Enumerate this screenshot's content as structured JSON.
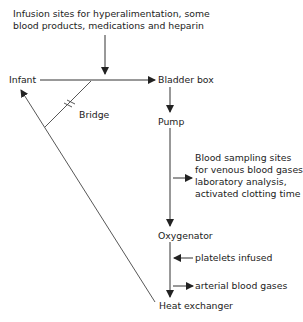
{
  "diagram": {
    "type": "flow",
    "nodes": {
      "infusion_note": [
        "Infusion sites for hyperalimentation, some",
        "blood products, medications and heparin"
      ],
      "infant": "Infant",
      "bladder_box": "Bladder box",
      "bridge": "Bridge",
      "pump": "Pump",
      "sampling_note": [
        "Blood sampling sites",
        "for venous blood gases,",
        "laboratory analysis,",
        "activated clotting time"
      ],
      "oxygenator": "Oxygenator",
      "platelets": "platelets infused",
      "arterial": "arterial blood gases",
      "heat_exchanger": "Heat exchanger"
    },
    "edges": [
      {
        "from": "Infant",
        "to": "Bladder box"
      },
      {
        "from": "Infusion sites",
        "to": "Infant-Bladder box line"
      },
      {
        "from": "Bladder box",
        "to": "Pump"
      },
      {
        "from": "Pump",
        "to": "Oxygenator"
      },
      {
        "from": "Pump-Oxygenator line",
        "to": "Blood sampling sites"
      },
      {
        "from": "platelets infused",
        "to": "Oxygenator-Heat exchanger line"
      },
      {
        "from": "Oxygenator-Heat exchanger line",
        "to": "arterial blood gases"
      },
      {
        "from": "Oxygenator",
        "to": "Heat exchanger"
      },
      {
        "from": "Heat exchanger",
        "to": "Infant"
      },
      {
        "from": "Bridge (clamped)",
        "to": "venous/arterial lines"
      }
    ],
    "colors": {
      "line": "#333333",
      "text": "#222222",
      "background": "#ffffff"
    }
  }
}
